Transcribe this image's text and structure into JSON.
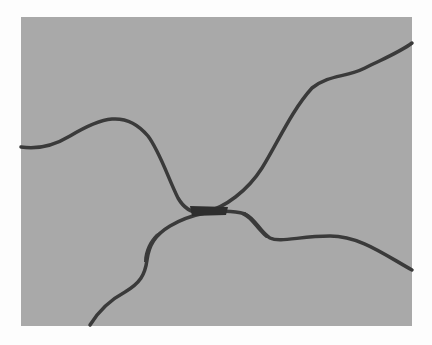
{
  "image": {
    "description": "Grayscale figure showing two dark curves on a gray background that nearly touch at a narrow junction near the center",
    "background_color": "#fdfdfd",
    "panel_color": "#a9a9a9",
    "curve_color": "#3a3a3a",
    "panel_bounds": {
      "x": 21,
      "y": 17,
      "width": 391,
      "height": 138
    },
    "curves": [
      {
        "name": "upper-curve",
        "description": "Starts at left edge mid-height, rises to a hump, dips down to the junction, then climbs to top-right corner"
      },
      {
        "name": "lower-curve",
        "description": "Starts at bottom near x=90, rises through a thick segment, meets junction, then runs right and descends to right edge"
      }
    ]
  }
}
